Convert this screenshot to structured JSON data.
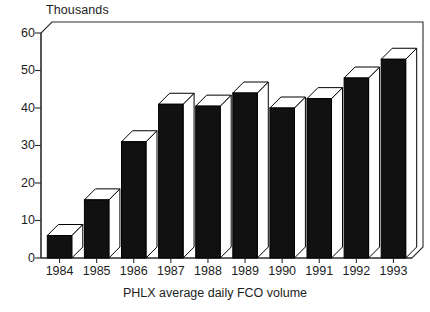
{
  "chart_data": {
    "type": "bar",
    "title": "",
    "subtitle": "",
    "unit_label": "Thousands",
    "xlabel": "PHLX average daily FCO volume",
    "ylabel": "Thousands",
    "categories": [
      "1984",
      "1985",
      "1986",
      "1987",
      "1988",
      "1989",
      "1990",
      "1991",
      "1992",
      "1993"
    ],
    "values": [
      6,
      15.5,
      31,
      41,
      40.5,
      44,
      40,
      42.5,
      48,
      53
    ],
    "ylim": [
      0,
      60
    ],
    "yticks": [
      0,
      10,
      20,
      30,
      40,
      50,
      60
    ],
    "ytick_labels": [
      "0",
      "10",
      "20",
      "30",
      "40",
      "50",
      "60"
    ],
    "grid": false,
    "legend": null,
    "style": "3d-column-black",
    "colors": {
      "bar_face": "#111111",
      "bar_top": "#ffffff",
      "bar_side": "#ffffff",
      "axis": "#2b2b2b",
      "text": "#1d1d1d",
      "background": "#ffffff"
    }
  }
}
